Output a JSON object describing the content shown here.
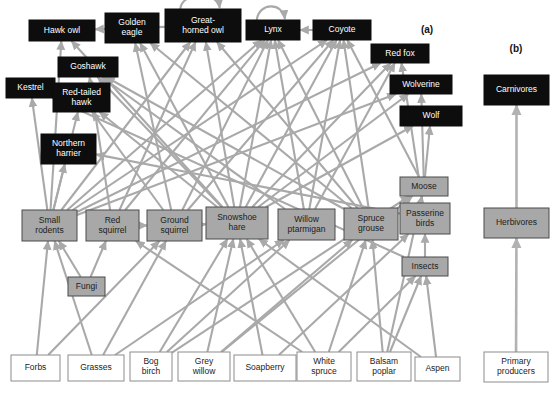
{
  "figure": {
    "panels": [
      {
        "id": "a",
        "label": "(a)",
        "x": 427,
        "y": 33
      },
      {
        "id": "b",
        "label": "(b)",
        "x": 516,
        "y": 52
      }
    ],
    "colors": {
      "carnivore_fill": "#0d0d0d",
      "carnivore_text": "#ffffff",
      "herbivore_fill": "#a8a8a8",
      "herbivore_stroke": "#4a4a4a",
      "producer_fill": "#ffffff",
      "producer_stroke": "#8c8c8c",
      "arrow": "#a9a9a9",
      "background": "#ffffff"
    }
  },
  "panel_a": {
    "carnivores": [
      {
        "id": "hawk_owl",
        "label": "Hawk owl",
        "lines": [
          "Hawk owl"
        ],
        "x": 29,
        "y": 20,
        "w": 66,
        "h": 21
      },
      {
        "id": "golden_eagle",
        "label": "Golden eagle",
        "lines": [
          "Golden",
          "eagle"
        ],
        "x": 105,
        "y": 13,
        "w": 54,
        "h": 30
      },
      {
        "id": "great_horned_owl",
        "label": "Great-horned owl",
        "lines": [
          "Great-",
          "horned owl"
        ],
        "x": 165,
        "y": 9,
        "w": 76,
        "h": 33
      },
      {
        "id": "lynx",
        "label": "Lynx",
        "lines": [
          "Lynx"
        ],
        "x": 246,
        "y": 20,
        "w": 54,
        "h": 20
      },
      {
        "id": "coyote",
        "label": "Coyote",
        "lines": [
          "Coyote"
        ],
        "x": 313,
        "y": 20,
        "w": 58,
        "h": 20
      },
      {
        "id": "red_fox",
        "label": "Red fox",
        "lines": [
          "Red fox"
        ],
        "x": 371,
        "y": 44,
        "w": 58,
        "h": 19
      },
      {
        "id": "goshawk",
        "label": "Goshawk",
        "lines": [
          "Goshawk"
        ],
        "x": 58,
        "y": 57,
        "w": 60,
        "h": 20
      },
      {
        "id": "kestrel",
        "label": "Kestrel",
        "lines": [
          "Kestrel"
        ],
        "x": 6,
        "y": 78,
        "w": 49,
        "h": 20
      },
      {
        "id": "red_tailed_hawk",
        "label": "Red-tailed hawk",
        "lines": [
          "Red-tailed",
          "hawk"
        ],
        "x": 53,
        "y": 83,
        "w": 57,
        "h": 29
      },
      {
        "id": "wolverine",
        "label": "Wolverine",
        "lines": [
          "Wolverine"
        ],
        "x": 390,
        "y": 75,
        "w": 62,
        "h": 19
      },
      {
        "id": "wolf",
        "label": "Wolf",
        "lines": [
          "Wolf"
        ],
        "x": 400,
        "y": 106,
        "w": 62,
        "h": 20
      },
      {
        "id": "northern_harrier",
        "label": "Northern harrier",
        "lines": [
          "Northern",
          "harrier"
        ],
        "x": 41,
        "y": 134,
        "w": 55,
        "h": 30
      }
    ],
    "herbivores": [
      {
        "id": "moose",
        "label": "Moose",
        "lines": [
          "Moose"
        ],
        "x": 400,
        "y": 177,
        "w": 48,
        "h": 19
      },
      {
        "id": "small_rodents",
        "label": "Small rodents",
        "lines": [
          "Small",
          "rodents"
        ],
        "x": 22,
        "y": 210,
        "w": 55,
        "h": 31
      },
      {
        "id": "red_squirrel",
        "label": "Red squirrel",
        "lines": [
          "Red",
          "squirrel"
        ],
        "x": 86,
        "y": 210,
        "w": 53,
        "h": 31
      },
      {
        "id": "ground_squirrel",
        "label": "Ground squirrel",
        "lines": [
          "Ground",
          "squirrel"
        ],
        "x": 147,
        "y": 210,
        "w": 55,
        "h": 31
      },
      {
        "id": "snowshoe_hare",
        "label": "Snowshoe hare",
        "lines": [
          "Snowshoe",
          "hare"
        ],
        "x": 206,
        "y": 207,
        "w": 62,
        "h": 32
      },
      {
        "id": "willow_ptarmigan",
        "label": "Willow ptarmigan",
        "lines": [
          "Willow",
          "ptarmigan"
        ],
        "x": 278,
        "y": 209,
        "w": 57,
        "h": 31
      },
      {
        "id": "spruce_grouse",
        "label": "Spruce grouse",
        "lines": [
          "Spruce",
          "grouse"
        ],
        "x": 344,
        "y": 208,
        "w": 54,
        "h": 32
      },
      {
        "id": "passerine_birds",
        "label": "Passerine birds",
        "lines": [
          "Passerine",
          "birds"
        ],
        "x": 400,
        "y": 203,
        "w": 50,
        "h": 31
      },
      {
        "id": "insects",
        "label": "Insects",
        "lines": [
          "Insects"
        ],
        "x": 402,
        "y": 257,
        "w": 46,
        "h": 19
      },
      {
        "id": "fungi",
        "label": "Fungi",
        "lines": [
          "Fungi"
        ],
        "x": 68,
        "y": 277,
        "w": 37,
        "h": 19
      }
    ],
    "producers": [
      {
        "id": "forbs",
        "label": "Forbs",
        "lines": [
          "Forbs"
        ],
        "x": 11,
        "y": 355,
        "w": 49,
        "h": 26
      },
      {
        "id": "grasses",
        "label": "Grasses",
        "lines": [
          "Grasses"
        ],
        "x": 68,
        "y": 355,
        "w": 56,
        "h": 26
      },
      {
        "id": "bog_birch",
        "label": "Bog birch",
        "lines": [
          "Bog",
          "birch"
        ],
        "x": 130,
        "y": 352,
        "w": 42,
        "h": 29
      },
      {
        "id": "grey_willow",
        "label": "Grey willow",
        "lines": [
          "Grey",
          "willow"
        ],
        "x": 178,
        "y": 352,
        "w": 52,
        "h": 29
      },
      {
        "id": "soapberry",
        "label": "Soapberry",
        "lines": [
          "Soapberry"
        ],
        "x": 234,
        "y": 355,
        "w": 62,
        "h": 26
      },
      {
        "id": "white_spruce",
        "label": "White spruce",
        "lines": [
          "White",
          "spruce"
        ],
        "x": 297,
        "y": 352,
        "w": 54,
        "h": 29
      },
      {
        "id": "balsam_poplar",
        "label": "Balsam poplar",
        "lines": [
          "Balsam",
          "poplar"
        ],
        "x": 357,
        "y": 352,
        "w": 54,
        "h": 29
      },
      {
        "id": "aspen",
        "label": "Aspen",
        "lines": [
          "Aspen"
        ],
        "x": 415,
        "y": 357,
        "w": 45,
        "h": 24
      }
    ]
  },
  "panel_b": {
    "nodes": [
      {
        "id": "carnivores",
        "label": "Carnivores",
        "lines": [
          "Carnivores"
        ],
        "type": "carnivore",
        "x": 484,
        "y": 75,
        "w": 65,
        "h": 30
      },
      {
        "id": "herbivores",
        "label": "Herbivores",
        "lines": [
          "Herbivores"
        ],
        "type": "herbivore",
        "x": 484,
        "y": 208,
        "w": 65,
        "h": 30
      },
      {
        "id": "primary_producers",
        "label": "Primary producers",
        "lines": [
          "Primary",
          "producers"
        ],
        "type": "producer",
        "x": 484,
        "y": 352,
        "w": 64,
        "h": 30
      }
    ],
    "links": [
      {
        "from": "primary_producers",
        "to": "herbivores"
      },
      {
        "from": "herbivores",
        "to": "carnivores"
      }
    ]
  },
  "food_web_links": [
    {
      "from": "snowshoe_hare",
      "to": "hawk_owl"
    },
    {
      "from": "small_rodents",
      "to": "hawk_owl"
    },
    {
      "from": "great_horned_owl",
      "to": "hawk_owl"
    },
    {
      "from": "small_rodents",
      "to": "kestrel"
    },
    {
      "from": "insects",
      "to": "kestrel"
    },
    {
      "from": "snowshoe_hare",
      "to": "goshawk"
    },
    {
      "from": "red_squirrel",
      "to": "goshawk"
    },
    {
      "from": "spruce_grouse",
      "to": "goshawk"
    },
    {
      "from": "willow_ptarmigan",
      "to": "goshawk"
    },
    {
      "from": "small_rodents",
      "to": "red_tailed_hawk"
    },
    {
      "from": "ground_squirrel",
      "to": "red_tailed_hawk"
    },
    {
      "from": "snowshoe_hare",
      "to": "red_tailed_hawk"
    },
    {
      "from": "small_rodents",
      "to": "northern_harrier"
    },
    {
      "from": "passerine_birds",
      "to": "northern_harrier"
    },
    {
      "from": "snowshoe_hare",
      "to": "golden_eagle"
    },
    {
      "from": "ground_squirrel",
      "to": "golden_eagle"
    },
    {
      "from": "spruce_grouse",
      "to": "golden_eagle"
    },
    {
      "from": "snowshoe_hare",
      "to": "great_horned_owl"
    },
    {
      "from": "small_rodents",
      "to": "great_horned_owl"
    },
    {
      "from": "red_squirrel",
      "to": "great_horned_owl"
    },
    {
      "from": "spruce_grouse",
      "to": "great_horned_owl"
    },
    {
      "from": "snowshoe_hare",
      "to": "lynx"
    },
    {
      "from": "red_squirrel",
      "to": "lynx"
    },
    {
      "from": "small_rodents",
      "to": "lynx"
    },
    {
      "from": "ground_squirrel",
      "to": "lynx"
    },
    {
      "from": "willow_ptarmigan",
      "to": "lynx"
    },
    {
      "from": "spruce_grouse",
      "to": "lynx"
    },
    {
      "from": "coyote",
      "to": "lynx"
    },
    {
      "from": "lynx",
      "to": "lynx"
    },
    {
      "from": "great_horned_owl",
      "to": "great_horned_owl"
    },
    {
      "from": "snowshoe_hare",
      "to": "coyote"
    },
    {
      "from": "small_rodents",
      "to": "coyote"
    },
    {
      "from": "ground_squirrel",
      "to": "coyote"
    },
    {
      "from": "willow_ptarmigan",
      "to": "coyote"
    },
    {
      "from": "spruce_grouse",
      "to": "coyote"
    },
    {
      "from": "moose",
      "to": "coyote"
    },
    {
      "from": "small_rodents",
      "to": "red_fox"
    },
    {
      "from": "snowshoe_hare",
      "to": "red_fox"
    },
    {
      "from": "willow_ptarmigan",
      "to": "red_fox"
    },
    {
      "from": "passerine_birds",
      "to": "red_fox"
    },
    {
      "from": "snowshoe_hare",
      "to": "wolverine"
    },
    {
      "from": "small_rodents",
      "to": "wolverine"
    },
    {
      "from": "moose",
      "to": "wolverine"
    },
    {
      "from": "moose",
      "to": "wolf"
    },
    {
      "from": "snowshoe_hare",
      "to": "wolf"
    },
    {
      "from": "insects",
      "to": "passerine_birds"
    },
    {
      "from": "forbs",
      "to": "small_rodents"
    },
    {
      "from": "grasses",
      "to": "small_rodents"
    },
    {
      "from": "fungi",
      "to": "small_rodents"
    },
    {
      "from": "fungi",
      "to": "red_squirrel"
    },
    {
      "from": "white_spruce",
      "to": "red_squirrel"
    },
    {
      "from": "grasses",
      "to": "ground_squirrel"
    },
    {
      "from": "forbs",
      "to": "ground_squirrel"
    },
    {
      "from": "red_squirrel",
      "to": "ground_squirrel"
    },
    {
      "from": "ground_squirrel",
      "to": "snowshoe_hare"
    },
    {
      "from": "grey_willow",
      "to": "snowshoe_hare"
    },
    {
      "from": "bog_birch",
      "to": "snowshoe_hare"
    },
    {
      "from": "soapberry",
      "to": "snowshoe_hare"
    },
    {
      "from": "white_spruce",
      "to": "snowshoe_hare"
    },
    {
      "from": "aspen",
      "to": "snowshoe_hare"
    },
    {
      "from": "grasses",
      "to": "willow_ptarmigan"
    },
    {
      "from": "bog_birch",
      "to": "willow_ptarmigan"
    },
    {
      "from": "grey_willow",
      "to": "spruce_grouse"
    },
    {
      "from": "white_spruce",
      "to": "spruce_grouse"
    },
    {
      "from": "balsam_poplar",
      "to": "spruce_grouse"
    },
    {
      "from": "soapberry",
      "to": "passerine_birds"
    },
    {
      "from": "white_spruce",
      "to": "insects"
    },
    {
      "from": "balsam_poplar",
      "to": "insects"
    },
    {
      "from": "aspen",
      "to": "insects"
    },
    {
      "from": "grey_willow",
      "to": "moose"
    },
    {
      "from": "balsam_poplar",
      "to": "moose"
    },
    {
      "from": "bog_birch",
      "to": "moose"
    }
  ]
}
